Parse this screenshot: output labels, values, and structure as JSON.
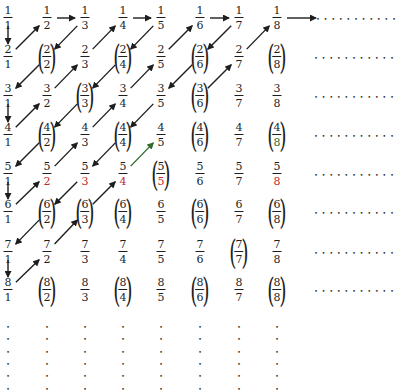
{
  "diagram": {
    "title": "",
    "columns": 8,
    "rows": 8,
    "circled_cells": [
      [
        2,
        2
      ],
      [
        2,
        4
      ],
      [
        2,
        6
      ],
      [
        2,
        8
      ],
      [
        3,
        3
      ],
      [
        3,
        6
      ],
      [
        4,
        2
      ],
      [
        4,
        4
      ],
      [
        4,
        6
      ],
      [
        4,
        8
      ],
      [
        5,
        5
      ],
      [
        6,
        2
      ],
      [
        6,
        3
      ],
      [
        6,
        4
      ],
      [
        6,
        6
      ],
      [
        6,
        8
      ],
      [
        7,
        7
      ],
      [
        8,
        2
      ],
      [
        8,
        4
      ],
      [
        8,
        6
      ],
      [
        8,
        8
      ]
    ],
    "colored_cells": [
      {
        "num": 5,
        "den": 2,
        "part": "den",
        "color": "#c0282d"
      },
      {
        "num": 5,
        "den": 3,
        "part": "den",
        "color": "#c0282d"
      },
      {
        "num": 5,
        "den": 4,
        "part": "den",
        "color": "#c0282d"
      },
      {
        "num": 5,
        "den": 5,
        "part": "den",
        "color": "#c0282d"
      },
      {
        "num": 5,
        "den": 8,
        "part": "den",
        "color": "#c0282d"
      },
      {
        "num": 4,
        "den": 8,
        "part": "den",
        "color": "#2f6b2a"
      }
    ],
    "arrows": [
      {
        "from": [
          1,
          1
        ],
        "to": [
          2,
          1
        ]
      },
      {
        "from": [
          2,
          1
        ],
        "to": [
          1,
          2
        ]
      },
      {
        "from": [
          1,
          2
        ],
        "to": [
          1,
          3
        ]
      },
      {
        "from": [
          1,
          3
        ],
        "to": [
          2,
          2
        ]
      },
      {
        "from": [
          2,
          2
        ],
        "to": [
          3,
          1
        ]
      },
      {
        "from": [
          3,
          1
        ],
        "to": [
          4,
          1
        ]
      },
      {
        "from": [
          4,
          1
        ],
        "to": [
          3,
          2
        ]
      },
      {
        "from": [
          3,
          2
        ],
        "to": [
          2,
          3
        ]
      },
      {
        "from": [
          2,
          3
        ],
        "to": [
          1,
          4
        ]
      },
      {
        "from": [
          1,
          4
        ],
        "to": [
          1,
          5
        ]
      },
      {
        "from": [
          1,
          5
        ],
        "to": [
          2,
          4
        ]
      },
      {
        "from": [
          2,
          4
        ],
        "to": [
          3,
          3
        ]
      },
      {
        "from": [
          3,
          3
        ],
        "to": [
          4,
          2
        ]
      },
      {
        "from": [
          4,
          2
        ],
        "to": [
          5,
          1
        ]
      },
      {
        "from": [
          5,
          1
        ],
        "to": [
          6,
          1
        ]
      },
      {
        "from": [
          6,
          1
        ],
        "to": [
          5,
          2
        ]
      },
      {
        "from": [
          5,
          2
        ],
        "to": [
          4,
          3
        ]
      },
      {
        "from": [
          4,
          3
        ],
        "to": [
          3,
          4
        ]
      },
      {
        "from": [
          3,
          4
        ],
        "to": [
          2,
          5
        ]
      },
      {
        "from": [
          2,
          5
        ],
        "to": [
          1,
          6
        ]
      },
      {
        "from": [
          1,
          6
        ],
        "to": [
          1,
          7
        ]
      },
      {
        "from": [
          1,
          7
        ],
        "to": [
          2,
          6
        ]
      },
      {
        "from": [
          2,
          6
        ],
        "to": [
          3,
          5
        ]
      },
      {
        "from": [
          3,
          5
        ],
        "to": [
          4,
          4
        ]
      },
      {
        "from": [
          4,
          4
        ],
        "to": [
          5,
          3
        ]
      },
      {
        "from": [
          5,
          3
        ],
        "to": [
          6,
          2
        ]
      },
      {
        "from": [
          6,
          2
        ],
        "to": [
          7,
          1
        ]
      },
      {
        "from": [
          7,
          1
        ],
        "to": [
          8,
          1
        ]
      },
      {
        "from": [
          8,
          1
        ],
        "to": [
          7,
          2
        ]
      },
      {
        "from": [
          7,
          2
        ],
        "to": [
          6,
          3
        ]
      },
      {
        "from": [
          6,
          3
        ],
        "to": [
          5,
          4
        ]
      },
      {
        "from": [
          5,
          4
        ],
        "to": [
          4,
          5
        ],
        "color": "#2f6b2a"
      },
      {
        "from": [
          3,
          6
        ],
        "to": [
          2,
          7
        ]
      },
      {
        "from": [
          2,
          7
        ],
        "to": [
          1,
          8
        ]
      },
      {
        "from": [
          1,
          8
        ],
        "to": "row-ellipsis",
        "long": true
      }
    ],
    "ellipsis_glyph": "•"
  }
}
